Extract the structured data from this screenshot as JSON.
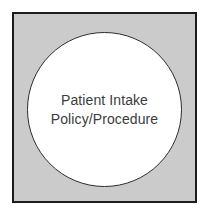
{
  "diagram": {
    "shape": {
      "type": "circle-in-square",
      "label_line1": "Patient Intake",
      "label_line2": "Policy/Procedure",
      "colors": {
        "square_fill": "#cbcbcb",
        "square_border": "#1c1c1c",
        "circle_fill": "#ffffff",
        "circle_border": "#2e2e2e",
        "text": "#3c3c3c",
        "background": "#ffffff"
      }
    }
  }
}
